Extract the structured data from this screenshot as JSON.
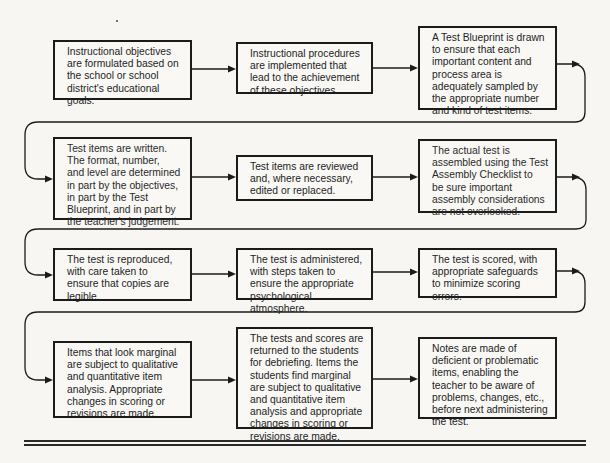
{
  "diagram": {
    "type": "flowchart",
    "layout": "3 columns x 4 rows, serpentine left-to-right with return loops",
    "steps": [
      {
        "id": 1,
        "text": "Instructional objectives\nare formulated based on\nthe school or school\ndistrict's educational\ngoals."
      },
      {
        "id": 2,
        "text": "Instructional procedures\nare implemented that\nlead to the achievement\nof these objectives."
      },
      {
        "id": 3,
        "text": "A Test Blueprint is drawn\nto ensure that each\nimportant content and\nprocess area is\nadequately sampled by\nthe appropriate number\nand kind of test items."
      },
      {
        "id": 4,
        "text": "Test items are written.\nThe format, number,\nand level are determined\nin part by the objectives,\nin part by the Test\nBlueprint, and in part by\nthe teacher's judgement."
      },
      {
        "id": 5,
        "text": "Test items are reviewed\nand, where necessary,\nedited or replaced."
      },
      {
        "id": 6,
        "text": "The actual test is\nassembled using the Test\nAssembly Checklist to\nbe sure important\nassembly considerations\nare not overlooked."
      },
      {
        "id": 7,
        "text": "The test is reproduced,\nwith care taken to\nensure that copies are\nlegible."
      },
      {
        "id": 8,
        "text": "The test is administered,\nwith steps taken to\nensure the appropriate\npsychological atmosphere."
      },
      {
        "id": 9,
        "text": "The test is scored, with\nappropriate safeguards\nto minimize scoring\nerrors."
      },
      {
        "id": 10,
        "text": "Items that look marginal\nare subject to qualitative\nand quantitative item\nanalysis. Appropriate\nchanges in scoring or\nrevisions are made."
      },
      {
        "id": 11,
        "text": "The tests and scores are\nreturned to the students\nfor debriefing. Items the\nstudents find marginal\nare subject to qualitative\nand quantitative item\nanalysis and appropriate\nchanges in scoring or\nrevisions are made."
      },
      {
        "id": 12,
        "text": "Notes are made of\ndeficient or problematic\nitems, enabling the\nteacher to be aware of\nproblems, changes, etc.,\nbefore next administering\nthe test."
      }
    ],
    "edges": [
      [
        1,
        2
      ],
      [
        2,
        3
      ],
      [
        3,
        4
      ],
      [
        4,
        5
      ],
      [
        5,
        6
      ],
      [
        6,
        7
      ],
      [
        7,
        8
      ],
      [
        8,
        9
      ],
      [
        9,
        10
      ],
      [
        10,
        11
      ],
      [
        11,
        12
      ]
    ],
    "colors": {
      "background": "#f7f6f3",
      "box_border": "#1b1b1b",
      "text": "#1e1e1e"
    }
  }
}
